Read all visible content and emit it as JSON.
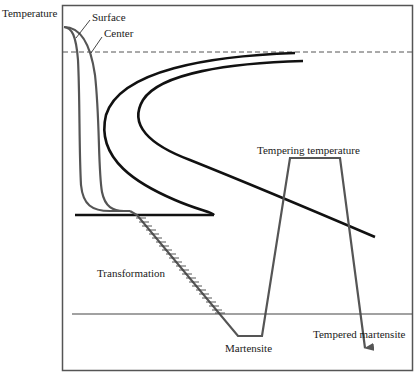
{
  "diagram": {
    "y_axis_label": "Temperature",
    "labels": {
      "surface": "Surface",
      "center": "Center",
      "tempering_temperature": "Tempering temperature",
      "transformation": "Transformation",
      "martensite": "Martensite",
      "tempered_martensite": "Tempered martensite"
    },
    "colors": {
      "frame": "#555555",
      "curves": "#111111",
      "cooling_path": "#555555",
      "dashed_line": "#555555"
    },
    "elements": [
      "frame",
      "dashed eutectoid temperature line",
      "surface cooling curve",
      "center cooling curve",
      "start-of-transformation C curve",
      "end-of-transformation C curve",
      "Ms horizontal line",
      "Mf horizontal line",
      "hatched martensite transformation band",
      "tempering path with arrow"
    ]
  }
}
